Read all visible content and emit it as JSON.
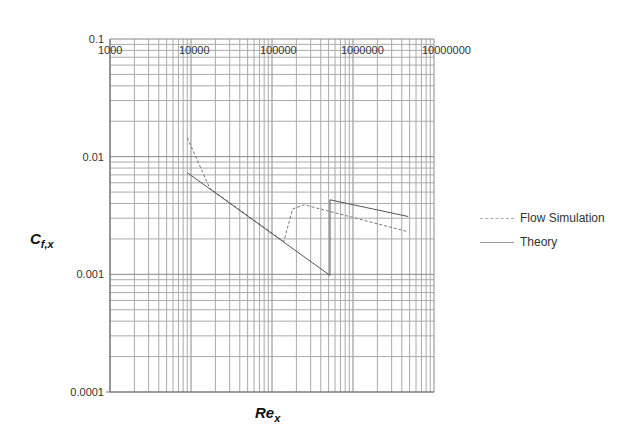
{
  "chart_data": {
    "type": "line",
    "title": "",
    "xlabel": "Re_x",
    "ylabel": "C_f,x",
    "xscale": "log",
    "yscale": "log",
    "xlim": [
      1000,
      10000000
    ],
    "ylim": [
      0.0001,
      0.1
    ],
    "x_tick_labels": [
      "1000",
      "10000",
      "100000",
      "1000000",
      "10000000"
    ],
    "y_tick_labels": [
      "0.1",
      "0.01",
      "0.001",
      "0.0001"
    ],
    "grid": true,
    "legend_position": "right",
    "series": [
      {
        "name": "Flow Simulation",
        "style": "dashed",
        "points": [
          [
            9000,
            0.0145
          ],
          [
            17000,
            0.0054
          ],
          [
            140000,
            0.0019
          ],
          [
            180000,
            0.0036
          ],
          [
            250000,
            0.0039
          ],
          [
            4800000,
            0.0023
          ]
        ]
      },
      {
        "name": "Theory",
        "style": "solid",
        "points": [
          [
            9000,
            0.0073
          ],
          [
            520000,
            0.00098
          ],
          [
            520000,
            0.0043
          ],
          [
            4800000,
            0.0031
          ]
        ]
      }
    ]
  },
  "axes": {
    "x_title_main": "Re",
    "x_title_sub": "x",
    "y_title_main": "C",
    "y_title_sub": "f,x"
  },
  "legend": {
    "items": [
      {
        "label": "Flow Simulation"
      },
      {
        "label": "Theory"
      }
    ]
  }
}
